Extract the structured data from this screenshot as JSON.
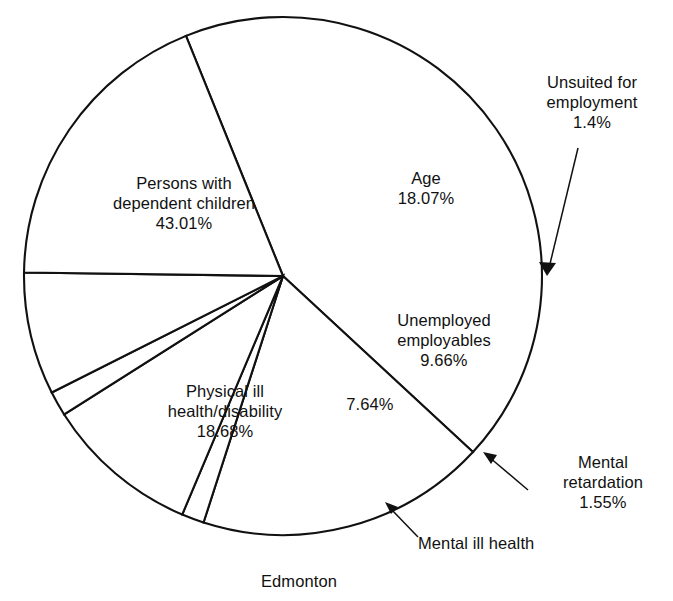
{
  "caption": "Edmonton",
  "chart_data": {
    "type": "pie",
    "title": "",
    "subtitle": "",
    "caption": "Edmonton",
    "xlabel": "",
    "ylabel": "",
    "legend": "none",
    "grid": false,
    "units": "percent",
    "categories": [
      "Persons with dependent children",
      "Age",
      "Unsuited for employment",
      "Unemployed employables",
      "Mental retardation",
      "Mental ill health",
      "Physical ill health/disability"
    ],
    "values": [
      43.01,
      18.07,
      1.4,
      9.66,
      1.55,
      7.64,
      18.68
    ],
    "slices": [
      {
        "label": "Persons with dependent children",
        "value": 43.01,
        "value_text": "43.01%",
        "label_lines": [
          "Persons with",
          "dependent children",
          "43.01%"
        ],
        "label_placement": "inside"
      },
      {
        "label": "Age",
        "value": 18.07,
        "value_text": "18.07%",
        "label_lines": [
          "Age",
          "18.07%"
        ],
        "label_placement": "inside"
      },
      {
        "label": "Unsuited for employment",
        "value": 1.4,
        "value_text": "1.4%",
        "label_lines": [
          "Unsuited for",
          "employment",
          "1.4%"
        ],
        "label_placement": "outside-leader"
      },
      {
        "label": "Unemployed employables",
        "value": 9.66,
        "value_text": "9.66%",
        "label_lines": [
          "Unemployed",
          "employables",
          "9.66%"
        ],
        "label_placement": "inside"
      },
      {
        "label": "Mental retardation",
        "value": 1.55,
        "value_text": "1.55%",
        "label_lines": [
          "Mental",
          "retardation",
          "1.55%"
        ],
        "label_placement": "outside-leader"
      },
      {
        "label": "Mental ill health",
        "value": 7.64,
        "value_text": "7.64%",
        "label_lines": [
          "Mental ill health"
        ],
        "label_placement": "outside-leader"
      },
      {
        "label": "Physical ill health/disability",
        "value": 18.68,
        "value_text": "18.68%",
        "label_lines": [
          "Physical ill",
          "health/disability",
          "18.68%"
        ],
        "label_placement": "inside"
      }
    ]
  },
  "labels": {
    "persons": "Persons with\ndependent children\n43.01%",
    "age": "Age\n18.07%",
    "unsuited": "Unsuited for\nemployment\n1.4%",
    "unemployed": "Unemployed\nemployables\n9.66%",
    "physical": "Physical ill\nhealth/disability\n18.68%",
    "unlabeled_slice": "7.64%",
    "mental_retardation": "Mental\nretardation\n1.55%",
    "mental_ill_health": "Mental ill health"
  },
  "colors": {
    "stroke": "#111111",
    "fill": "#ffffff",
    "background": "#ffffff"
  }
}
